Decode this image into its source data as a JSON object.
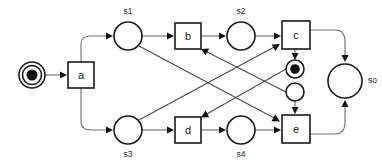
{
  "diagram": {
    "type": "petri-net",
    "width": 382,
    "height": 167,
    "colors": {
      "background": "#ffffff",
      "stroke": "#1a1a1a",
      "arc": "#6e6e6e",
      "token": "#111111",
      "label": "#1a1a1a"
    }
  },
  "places": [
    {
      "id": "p_init",
      "label": "",
      "name_label": "",
      "tokens": 1,
      "style": "double-ring",
      "cx": 32,
      "cy": 75,
      "r": 13
    },
    {
      "id": "s1",
      "label": "s1",
      "name_label": "s1",
      "tokens": 0,
      "style": "plain",
      "cx": 128,
      "cy": 36,
      "r": 14,
      "label_x": 128,
      "label_y": 12
    },
    {
      "id": "s2",
      "label": "s2",
      "name_label": "s2",
      "tokens": 0,
      "style": "plain",
      "cx": 241,
      "cy": 36,
      "r": 14,
      "label_x": 241,
      "label_y": 12
    },
    {
      "id": "s3",
      "label": "s3",
      "name_label": "s3",
      "tokens": 0,
      "style": "plain",
      "cx": 128,
      "cy": 130,
      "r": 14,
      "label_x": 128,
      "label_y": 155
    },
    {
      "id": "s4",
      "label": "s4",
      "name_label": "s4",
      "tokens": 0,
      "style": "plain",
      "cx": 241,
      "cy": 130,
      "r": 14,
      "label_x": 241,
      "label_y": 155
    },
    {
      "id": "so",
      "label": "so",
      "name_label": "so",
      "tokens": 0,
      "style": "plain",
      "cx": 345,
      "cy": 81,
      "r": 17,
      "label_x": 370,
      "label_y": 81
    },
    {
      "id": "p_mid_top",
      "label": "",
      "name_label": "",
      "tokens": 1,
      "style": "double-ring",
      "cx": 295,
      "cy": 69,
      "r": 9
    },
    {
      "id": "p_mid_bottom",
      "label": "",
      "name_label": "",
      "tokens": 0,
      "style": "plain",
      "cx": 295,
      "cy": 92,
      "r": 9
    }
  ],
  "transitions": [
    {
      "id": "a",
      "label": "a",
      "x": 68,
      "y": 62,
      "w": 26,
      "h": 26
    },
    {
      "id": "b",
      "label": "b",
      "x": 175,
      "y": 23,
      "w": 26,
      "h": 26
    },
    {
      "id": "c",
      "label": "c",
      "x": 282,
      "y": 21,
      "w": 28,
      "h": 28
    },
    {
      "id": "d",
      "label": "d",
      "x": 175,
      "y": 117,
      "w": 26,
      "h": 26
    },
    {
      "id": "e",
      "label": "e",
      "x": 282,
      "y": 115,
      "w": 28,
      "h": 28
    }
  ],
  "arcs": [
    {
      "from": "p_init",
      "to": "a",
      "kind": "straight"
    },
    {
      "from": "a",
      "to": "s1",
      "kind": "curve-up"
    },
    {
      "from": "a",
      "to": "s3",
      "kind": "curve-down"
    },
    {
      "from": "s1",
      "to": "b",
      "kind": "straight"
    },
    {
      "from": "b",
      "to": "s2",
      "kind": "straight"
    },
    {
      "from": "s2",
      "to": "c",
      "kind": "straight"
    },
    {
      "from": "s3",
      "to": "d",
      "kind": "straight"
    },
    {
      "from": "d",
      "to": "s4",
      "kind": "straight"
    },
    {
      "from": "s4",
      "to": "e",
      "kind": "straight"
    },
    {
      "from": "s1",
      "to": "e",
      "kind": "diagonal-down-right"
    },
    {
      "from": "s3",
      "to": "c",
      "kind": "diagonal-up-right"
    },
    {
      "from": "c",
      "to": "p_mid_top",
      "kind": "straight-down"
    },
    {
      "from": "p_mid_top",
      "to": "d",
      "kind": "diagonal-down-left"
    },
    {
      "from": "p_mid_bottom",
      "to": "b",
      "kind": "diagonal-up-left"
    },
    {
      "from": "p_mid_bottom",
      "to": "e",
      "kind": "straight-down"
    },
    {
      "from": "c",
      "to": "so",
      "kind": "curve-right-down"
    },
    {
      "from": "e",
      "to": "so",
      "kind": "curve-right-up"
    }
  ]
}
